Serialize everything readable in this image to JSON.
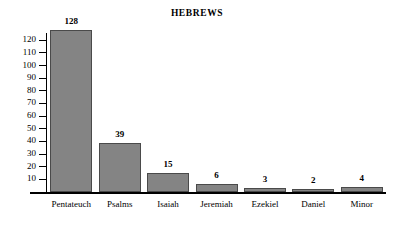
{
  "chart_data": {
    "type": "bar",
    "title": "HEBREWS",
    "xlabel": "",
    "ylabel": "",
    "categories": [
      "Pentateuch",
      "Psalms",
      "Isaiah",
      "Jeremiah",
      "Ezekiel",
      "Daniel",
      "Minor"
    ],
    "values": [
      128,
      39,
      15,
      6,
      3,
      2,
      4
    ],
    "value_labels": [
      "128",
      "39",
      "15",
      "6",
      "3",
      "2",
      "4"
    ],
    "ylim": [
      0,
      128
    ],
    "yticks": [
      120,
      110,
      100,
      90,
      80,
      70,
      60,
      50,
      40,
      30,
      20,
      10
    ],
    "ytick_labels": [
      "120",
      "110",
      "100",
      "90",
      "80",
      "70",
      "60",
      "50",
      "40",
      "30",
      "20",
      "10"
    ],
    "grid": false,
    "legend": null,
    "bar_color": "#848484",
    "bar_border_color": "#4a4a4a",
    "axis_color": "#000000",
    "background": "#ffffff"
  }
}
